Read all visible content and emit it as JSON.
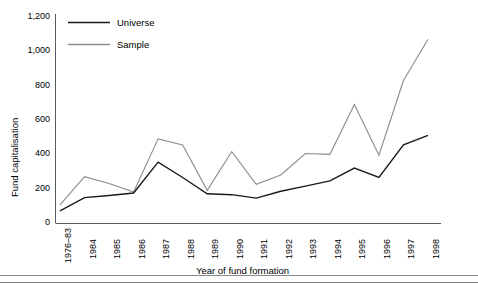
{
  "chart_data": {
    "type": "line",
    "title": "",
    "xlabel": "Year of fund formation",
    "ylabel": "Fund capitalisation",
    "categories": [
      "1976–83",
      "1984",
      "1985",
      "1986",
      "1987",
      "1988",
      "1989",
      "1990",
      "1991",
      "1992",
      "1993",
      "1994",
      "1995",
      "1996",
      "1997",
      "1998"
    ],
    "ylim": [
      0,
      1200
    ],
    "yticks": [
      0,
      200,
      400,
      600,
      800,
      1000,
      1200
    ],
    "ytick_labels": [
      "0",
      "200",
      "400",
      "600",
      "800",
      "1,000",
      "1,200"
    ],
    "grid": false,
    "legend_position": "top-left",
    "series": [
      {
        "name": "Universe",
        "color": "#1a1a1a",
        "values": [
          70,
          148,
          160,
          175,
          355,
          265,
          170,
          165,
          145,
          185,
          215,
          245,
          320,
          265,
          455,
          510
        ]
      },
      {
        "name": "Sample",
        "color": "#8c8c8c",
        "values": [
          105,
          270,
          230,
          180,
          490,
          455,
          190,
          415,
          225,
          280,
          405,
          400,
          690,
          395,
          830,
          1070
        ]
      }
    ]
  },
  "axis": {
    "ylabel": "Fund capitalisation",
    "xlabel": "Year of fund formation"
  },
  "legend": {
    "entries": [
      {
        "label": "Universe"
      },
      {
        "label": "Sample"
      }
    ]
  },
  "colors": {
    "universe": "#1a1a1a",
    "sample": "#8c8c8c",
    "axis": "#5a5a5a",
    "rule": "#8a8a8a"
  }
}
